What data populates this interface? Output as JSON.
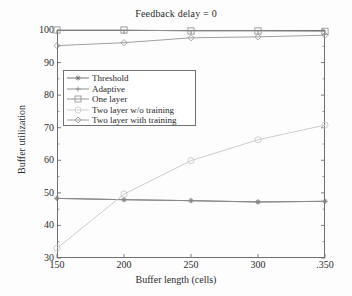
{
  "chart_data": {
    "type": "line",
    "title": "Feedback delay = 0",
    "xlabel": "Buffer length (cells)",
    "ylabel": "Buffer utilization",
    "x": [
      150,
      200,
      250,
      300,
      350
    ],
    "xtick_labels": [
      "150",
      "200",
      "250",
      "300",
      ".350"
    ],
    "ytick_labels": [
      "30",
      "40",
      "50",
      "60",
      "70",
      "80",
      "90",
      "100"
    ],
    "xlim": [
      150,
      350
    ],
    "ylim": [
      30,
      100
    ],
    "grid": false,
    "legend_position": "upper left inside",
    "series": [
      {
        "name": "Threshold",
        "marker": "star",
        "color": "#6e6e6e",
        "values": [
          48.3,
          47.9,
          47.6,
          47.2,
          47.4
        ]
      },
      {
        "name": "Adaptive",
        "marker": "plus",
        "color": "#8a8a8a",
        "values": [
          48.3,
          47.9,
          47.6,
          47.2,
          47.4
        ]
      },
      {
        "name": "One layer",
        "marker": "square",
        "color": "#8f8f8f",
        "values": [
          100.0,
          100.0,
          99.7,
          99.7,
          99.6
        ]
      },
      {
        "name": "Two layer w/o training",
        "marker": "circle",
        "color": "#c9c9c9",
        "values": [
          33.0,
          49.6,
          59.9,
          66.3,
          70.8
        ]
      },
      {
        "name": "Two layer with training",
        "marker": "diamond",
        "color": "#9a9a9a",
        "values": [
          95.2,
          96.1,
          97.6,
          97.9,
          98.4
        ]
      }
    ]
  },
  "legend": {
    "entries": [
      {
        "label": "Threshold",
        "marker": "star-marker"
      },
      {
        "label": "Adaptive",
        "marker": "plus-marker"
      },
      {
        "label": "One layer",
        "marker": "square-marker"
      },
      {
        "label": "Two layer w/o training",
        "marker": "circle-marker"
      },
      {
        "label": "Two layer with training",
        "marker": "diamond-marker"
      }
    ]
  },
  "colors": {
    "axis": "#6f6f6f",
    "text": "#2a2a2a",
    "background": "#fdfdfd"
  }
}
